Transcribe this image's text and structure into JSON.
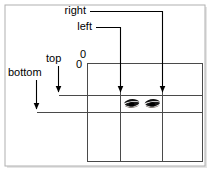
{
  "figure": {
    "background_color": "#ffffff",
    "frame_color": "#b3b3b3",
    "line_color": "#000000",
    "grid_color": "#555555",
    "width": 211,
    "height": 172
  },
  "labels": {
    "right": "right",
    "left": "left",
    "top": "top",
    "bottom": "bottom",
    "origin_x": "0",
    "origin_y": "0"
  },
  "annotations": [
    {
      "name": "right",
      "text": "right",
      "direction": "horizontal-right",
      "label_x": 86,
      "label_y": 14,
      "arrow_from_x": 92,
      "arrow_to_x": 162,
      "arrow_y": 11
    },
    {
      "name": "left",
      "text": "left",
      "direction": "horizontal-right",
      "label_x": 92,
      "label_y": 30,
      "arrow_from_x": 98,
      "arrow_to_x": 120,
      "arrow_y": 27
    },
    {
      "name": "top",
      "text": "top",
      "direction": "vertical-down",
      "label_x": 46,
      "label_y": 62,
      "arrow_from_y": 66,
      "arrow_to_y": 95,
      "arrow_x": 58
    },
    {
      "name": "bottom",
      "text": "bottom",
      "direction": "vertical-down",
      "label_x": 8,
      "label_y": 76,
      "arrow_from_y": 80,
      "arrow_to_y": 112,
      "arrow_x": 36
    }
  ],
  "box_model": {
    "outer_rect": {
      "x": 87,
      "y": 63,
      "width": 116,
      "height": 99
    },
    "vertical_lines_x": [
      87,
      120,
      162,
      203
    ],
    "horizontal_lines_y": [
      63,
      95,
      112,
      162
    ],
    "origin_marker_x": 87,
    "origin_marker_y": 63
  },
  "eyes_strip": {
    "name": "eyes-photo",
    "x": 120,
    "y": 96,
    "width": 42,
    "height": 16,
    "description": "pair of eyes"
  }
}
